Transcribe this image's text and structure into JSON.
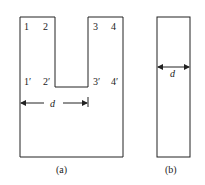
{
  "figure_a": {
    "caption": "(a)",
    "top_labels": [
      "1",
      "2",
      "3",
      "4"
    ],
    "bottom_labels": [
      "1′",
      "2′",
      "3′",
      "4′"
    ],
    "dimension_label": "d"
  },
  "figure_b": {
    "caption": "(b)",
    "dimension_label": "d"
  },
  "colors": {
    "stroke": "#222222",
    "background": "#ffffff"
  }
}
